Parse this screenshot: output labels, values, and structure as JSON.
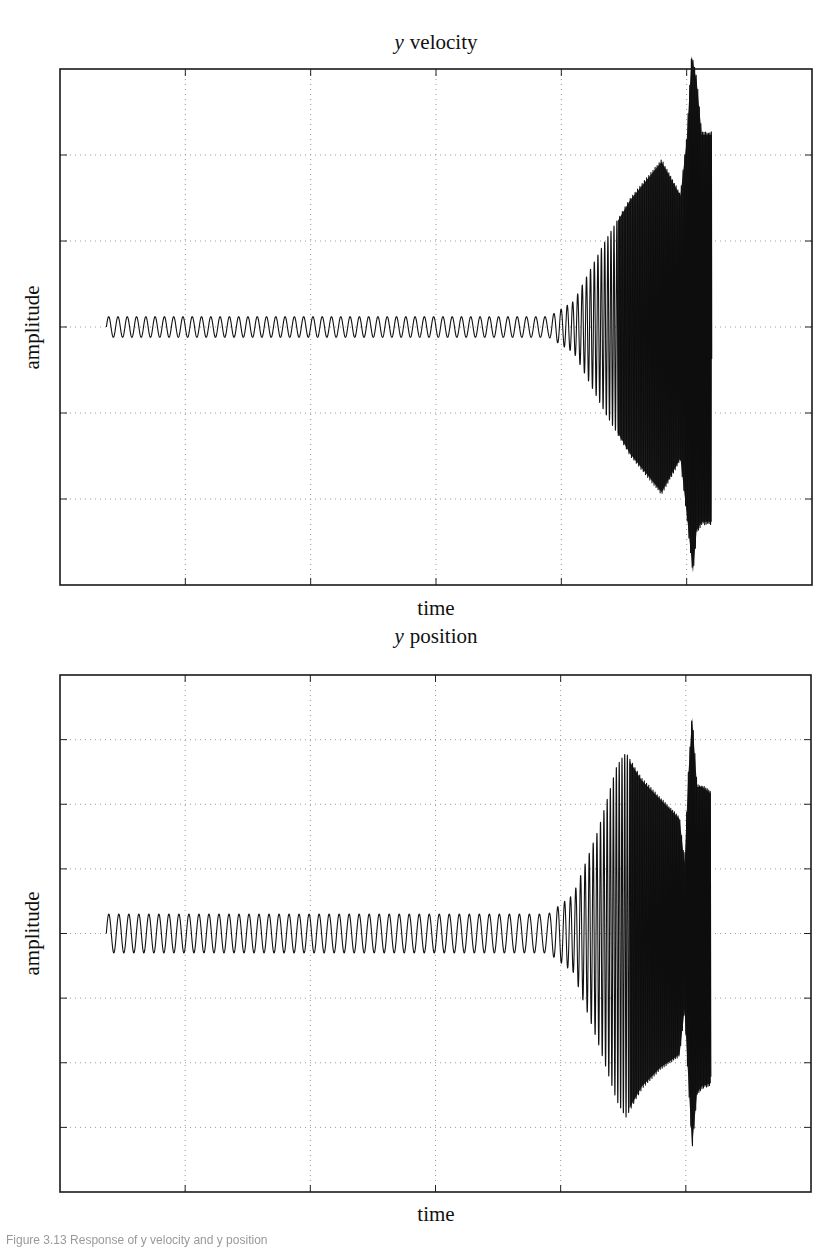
{
  "figure": {
    "caption": "Figure 3.13 Response of y velocity and y position"
  },
  "chart_data": [
    {
      "type": "line",
      "title": "y velocity",
      "title_var": "y",
      "title_rest": "velocity",
      "xlabel": "time",
      "ylabel": "amplitude",
      "grid": true,
      "grid_style": "dotted",
      "xticks_labels": [],
      "yticks_labels": [],
      "xlim": [
        0,
        6
      ],
      "ylim": [
        -3,
        3
      ],
      "x_gridlines": [
        1,
        2,
        3,
        4,
        5
      ],
      "y_gridlines": [
        -2,
        -1,
        0,
        1,
        2
      ],
      "frame": {
        "left": 60,
        "top": 69,
        "right": 812,
        "bottom": 585
      },
      "signal": {
        "description": "Small steady oscillation, then growing oscillation from t~3.9, saturating dense band; sharp spike near t~5.05 then constant-amplitude block until t~5.2",
        "t_start": 0.37,
        "t_end": 5.2,
        "cycles_per_unit": 13.5,
        "envelope": [
          [
            0.37,
            0.12
          ],
          [
            3.9,
            0.12
          ],
          [
            4.1,
            0.3
          ],
          [
            4.35,
            1.0
          ],
          [
            4.55,
            1.5
          ],
          [
            4.8,
            1.95
          ],
          [
            4.95,
            1.55
          ],
          [
            5.0,
            2.2
          ],
          [
            5.04,
            3.2
          ],
          [
            5.08,
            2.9
          ],
          [
            5.12,
            2.27
          ],
          [
            5.2,
            2.27
          ]
        ],
        "lower_envelope": [
          [
            0.37,
            -0.12
          ],
          [
            3.9,
            -0.12
          ],
          [
            4.1,
            -0.3
          ],
          [
            4.35,
            -1.0
          ],
          [
            4.55,
            -1.5
          ],
          [
            4.8,
            -1.95
          ],
          [
            4.95,
            -1.55
          ],
          [
            5.0,
            -2.2
          ],
          [
            5.05,
            -2.9
          ],
          [
            5.08,
            -2.4
          ],
          [
            5.12,
            -2.3
          ],
          [
            5.2,
            -2.3
          ]
        ]
      }
    },
    {
      "type": "line",
      "title": "y position",
      "title_var": "y",
      "title_rest": "position",
      "xlabel": "time",
      "ylabel": "amplitude",
      "grid": true,
      "grid_style": "dotted",
      "xticks_labels": [],
      "yticks_labels": [],
      "xlim": [
        0,
        6
      ],
      "ylim": [
        -4,
        4
      ],
      "x_gridlines": [
        1,
        2,
        3,
        4,
        5
      ],
      "y_gridlines": [
        -3,
        -2,
        -1,
        0,
        1,
        2,
        3
      ],
      "frame": {
        "left": 60,
        "top": 675,
        "right": 811,
        "bottom": 1192
      },
      "signal": {
        "description": "Small steady oscillation, growth from t~3.9 to a peak near t~4.5, decaying plateau to t~4.95, dip then spike near t~5.03, block until t~5.2",
        "t_start": 0.37,
        "t_end": 5.2,
        "cycles_per_unit": 12.5,
        "envelope": [
          [
            0.37,
            0.3
          ],
          [
            3.9,
            0.3
          ],
          [
            4.1,
            0.6
          ],
          [
            4.3,
            1.6
          ],
          [
            4.45,
            2.6
          ],
          [
            4.52,
            2.8
          ],
          [
            4.65,
            2.4
          ],
          [
            4.8,
            2.1
          ],
          [
            4.95,
            1.8
          ],
          [
            4.99,
            1.1
          ],
          [
            5.02,
            2.5
          ],
          [
            5.05,
            3.4
          ],
          [
            5.09,
            2.3
          ],
          [
            5.13,
            2.3
          ],
          [
            5.2,
            2.2
          ]
        ],
        "lower_envelope": [
          [
            0.37,
            -0.3
          ],
          [
            3.9,
            -0.3
          ],
          [
            4.1,
            -0.6
          ],
          [
            4.3,
            -1.7
          ],
          [
            4.45,
            -2.6
          ],
          [
            4.52,
            -2.85
          ],
          [
            4.65,
            -2.4
          ],
          [
            4.8,
            -2.1
          ],
          [
            4.95,
            -1.9
          ],
          [
            4.99,
            -1.2
          ],
          [
            5.02,
            -2.3
          ],
          [
            5.05,
            -3.35
          ],
          [
            5.09,
            -2.5
          ],
          [
            5.13,
            -2.4
          ],
          [
            5.2,
            -2.35
          ]
        ]
      }
    }
  ]
}
